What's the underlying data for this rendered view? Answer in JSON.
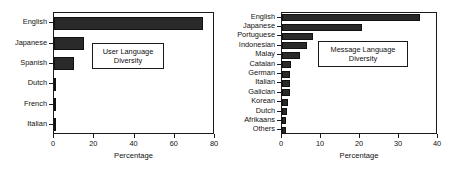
{
  "figure": {
    "background": "#ffffff",
    "bar_color": "#2a2a2a",
    "axis_color": "#1a1a1a",
    "text_color": "#111111"
  },
  "charts": [
    {
      "id": "user-language-diversity",
      "annotation": {
        "line1": "User Language",
        "line2": "Diversity"
      },
      "chart_data": {
        "type": "bar",
        "orientation": "horizontal",
        "title": "User Language Diversity",
        "xlabel": "Percentage",
        "ylabel": "",
        "xlim": [
          0,
          80
        ],
        "xticks": [
          0,
          20,
          40,
          60,
          80
        ],
        "xticklabels": [
          "0",
          "20",
          "40",
          "60",
          "80"
        ],
        "grid": false,
        "legend": "none",
        "categories": [
          "English",
          "Japanese",
          "Spanish",
          "Dutch",
          "French",
          "Italian"
        ],
        "values": [
          74,
          15,
          10,
          1,
          1,
          1
        ]
      }
    },
    {
      "id": "message-language-diversity",
      "annotation": {
        "line1": "Message Language",
        "line2": "Diversity"
      },
      "chart_data": {
        "type": "bar",
        "orientation": "horizontal",
        "title": "Message Language Diversity",
        "xlabel": "Percentage",
        "ylabel": "",
        "xlim": [
          0,
          40
        ],
        "xticks": [
          0,
          10,
          20,
          30,
          40
        ],
        "xticklabels": [
          "0",
          "10",
          "20",
          "30",
          "40"
        ],
        "grid": false,
        "legend": "none",
        "categories": [
          "English",
          "Japanese",
          "Portuguese",
          "Indonesian",
          "Malay",
          "Catalan",
          "German",
          "Italian",
          "Galician",
          "Korean",
          "Dutch",
          "Afrikaans",
          "Others"
        ],
        "values": [
          35.3,
          20.5,
          8.0,
          6.5,
          4.5,
          2.2,
          2.1,
          2.0,
          2.0,
          1.5,
          1.2,
          1.1,
          1.0
        ]
      }
    }
  ]
}
